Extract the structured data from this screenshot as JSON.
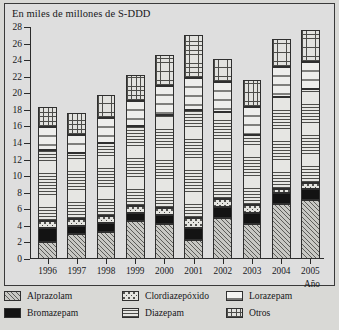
{
  "chart": {
    "title": "En miles de millones de S-DDD",
    "xaxis_name": "Año"
  },
  "chart_data": {
    "type": "bar",
    "title": "En miles de millones de S-DDD",
    "xlabel": "Año",
    "ylabel": "En miles de millones de S-DDD",
    "ylim": [
      0,
      28
    ],
    "ytick_step": 2,
    "grid": false,
    "stacked": true,
    "legend_position": "bottom",
    "categories": [
      "1996",
      "1997",
      "1998",
      "1999",
      "2000",
      "2001",
      "2002",
      "2003",
      "2004",
      "2005"
    ],
    "yticks": [
      "0",
      "2",
      "4",
      "6",
      "8",
      "10",
      "12",
      "14",
      "16",
      "18",
      "20",
      "22",
      "24",
      "26",
      "28"
    ],
    "series": [
      {
        "name": "Alprazolam",
        "values": [
          2.1,
          3.0,
          3.3,
          4.6,
          4.2,
          2.3,
          4.9,
          4.2,
          6.6,
          7.1
        ]
      },
      {
        "name": "Bromazepam",
        "values": [
          1.6,
          1.0,
          1.0,
          0.9,
          1.1,
          1.4,
          1.4,
          1.4,
          1.4,
          1.3
        ]
      },
      {
        "name": "Clordiazepóxido",
        "values": [
          0.9,
          0.8,
          0.9,
          0.9,
          0.8,
          1.3,
          0.9,
          0.9,
          0.4,
          0.8
        ]
      },
      {
        "name": "Diazepam",
        "values": [
          8.6,
          8.0,
          8.8,
          9.6,
          11.3,
          13.0,
          10.6,
          8.5,
          11.2,
          11.3
        ]
      },
      {
        "name": "Lorazepam",
        "values": [
          2.7,
          2.2,
          3.0,
          3.1,
          3.5,
          3.8,
          3.6,
          3.4,
          3.6,
          3.3
        ]
      },
      {
        "name": "Otros",
        "values": [
          2.4,
          2.6,
          2.8,
          3.1,
          3.7,
          5.2,
          2.8,
          3.2,
          3.4,
          3.9
        ]
      }
    ],
    "totals": [
      18.3,
      17.6,
      19.8,
      22.2,
      24.6,
      27.0,
      24.2,
      21.6,
      26.6,
      27.7
    ]
  },
  "legend": {
    "items": [
      {
        "label": "Alprazolam",
        "pattern": "diagonal-hatch"
      },
      {
        "label": "Bromazepam",
        "pattern": "solid-black"
      },
      {
        "label": "Clordiazepóxido",
        "pattern": "dotted"
      },
      {
        "label": "Diazepam",
        "pattern": "horizontal-lines"
      },
      {
        "label": "Lorazepam",
        "pattern": "sparse-dashes"
      },
      {
        "label": "Otros",
        "pattern": "grid-crosshatch"
      }
    ]
  }
}
